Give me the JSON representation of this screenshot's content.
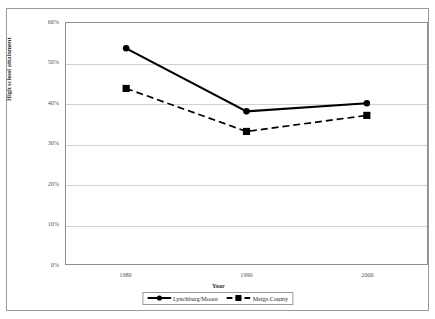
{
  "chart_data": {
    "type": "line",
    "title": "",
    "xlabel": "Year",
    "ylabel": "High school attainment",
    "categories": [
      "1980",
      "1990",
      "2000"
    ],
    "x": [
      1980,
      1990,
      2000
    ],
    "ylim": [
      0,
      60
    ],
    "ytick_labels": [
      "60%",
      "50%",
      "40%",
      "30%",
      "20%",
      "10%",
      "0%"
    ],
    "ytick_values": [
      60,
      50,
      40,
      30,
      20,
      10,
      0
    ],
    "ytick_format": "percent",
    "grid": "horizontal",
    "legend_position": "bottom-center",
    "series": [
      {
        "name": "Lynchburg/Moore",
        "values": [
          53.7,
          38.0,
          40.0
        ],
        "marker": "circle",
        "line_style": "solid",
        "color": "#000000"
      },
      {
        "name": "Meigs County",
        "values": [
          43.7,
          33.0,
          37.0
        ],
        "marker": "square",
        "line_style": "dashed",
        "color": "#000000"
      }
    ]
  },
  "axes": {
    "y_title": "High school attainment",
    "x_title": "Year",
    "y_ticks": [
      {
        "label": "60%"
      },
      {
        "label": "50%"
      },
      {
        "label": "40%"
      },
      {
        "label": "30%"
      },
      {
        "label": "20%"
      },
      {
        "label": "10%"
      },
      {
        "label": "0%"
      }
    ],
    "x_ticks": [
      {
        "label": "1980"
      },
      {
        "label": "1990"
      },
      {
        "label": "2000"
      }
    ]
  },
  "legend": {
    "entries": [
      {
        "label": "Lynchburg/Moore"
      },
      {
        "label": "Meigs County"
      }
    ]
  },
  "colors": {
    "series_line": "#000000",
    "gridline": "#d2d2d2",
    "plot_border": "#8f8f8f",
    "frame_border": "#9a9a9a",
    "tick_text": "#555555",
    "axis_title_text": "#333333",
    "background": "#ffffff"
  }
}
